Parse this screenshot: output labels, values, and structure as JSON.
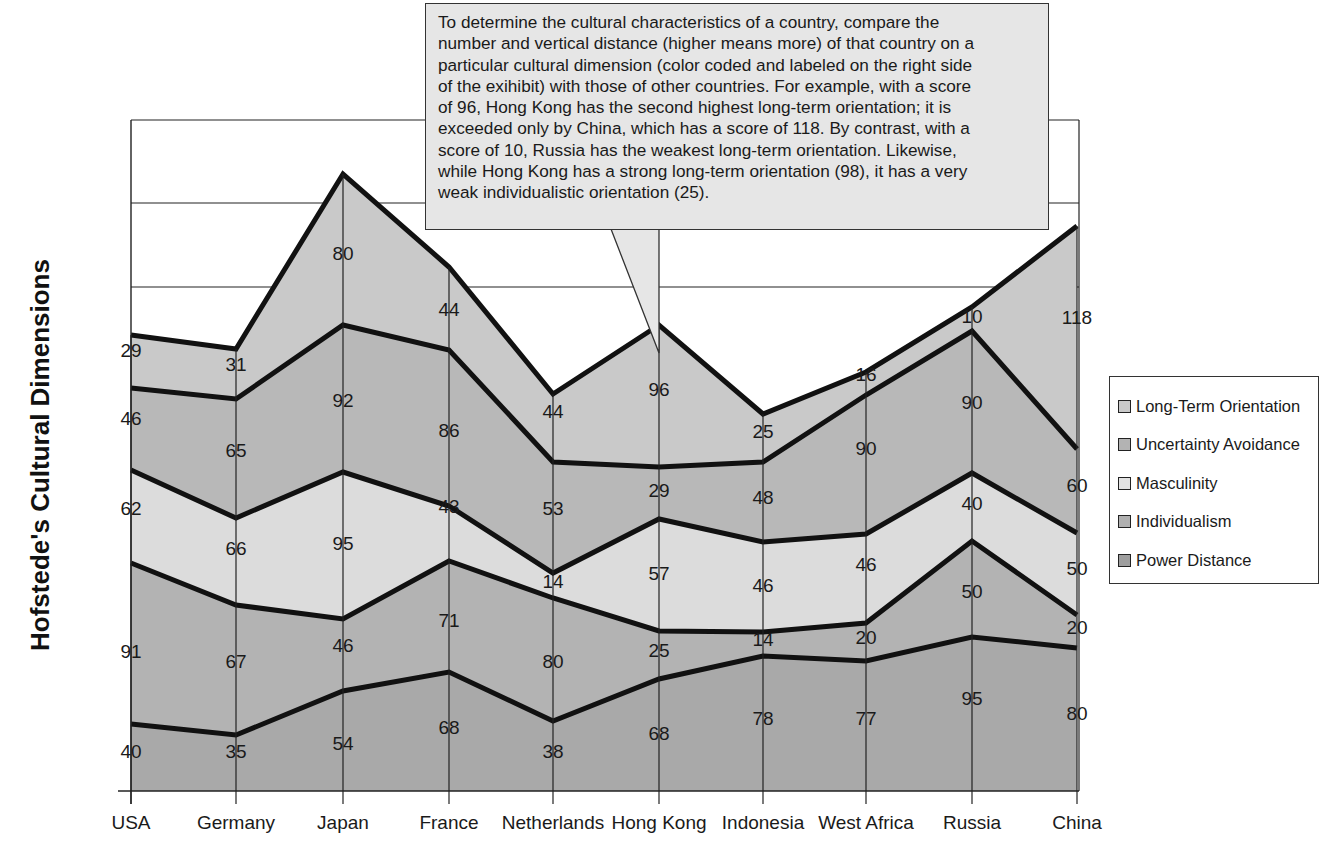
{
  "chart_data": {
    "type": "area",
    "stacked": true,
    "title": "",
    "ylabel": "Hofstede's Cultural Dimensions",
    "xlabel": "",
    "categories": [
      "USA",
      "Germany",
      "Japan",
      "France",
      "Netherlands",
      "Hong Kong",
      "Indonesia",
      "West Africa",
      "Russia",
      "China"
    ],
    "series": [
      {
        "name": "Power Distance",
        "color": "#a9a9a9",
        "values": [
          40,
          35,
          54,
          68,
          38,
          68,
          78,
          77,
          95,
          80
        ]
      },
      {
        "name": "Individualism",
        "color": "#b3b3b3",
        "values": [
          91,
          67,
          46,
          71,
          80,
          25,
          14,
          20,
          50,
          20
        ]
      },
      {
        "name": "Masculinity",
        "color": "#dcdcdc",
        "values": [
          62,
          66,
          95,
          43,
          14,
          57,
          46,
          46,
          40,
          50
        ]
      },
      {
        "name": "Uncertainty Avoidance",
        "color": "#b8b8b8",
        "values": [
          46,
          65,
          92,
          86,
          53,
          29,
          48,
          90,
          90,
          60
        ]
      },
      {
        "name": "Long-Term Orientation",
        "color": "#c9c9c9",
        "values": [
          29,
          31,
          80,
          44,
          44,
          96,
          25,
          16,
          10,
          118
        ]
      }
    ],
    "legend": {
      "position": "right",
      "entries": [
        "Long-Term Orientation",
        "Uncertainty Avoidance",
        "Masculinity",
        "Individualism",
        "Power Distance"
      ]
    },
    "grid": {
      "horizontal": true,
      "vertical_at_categories": true
    },
    "annotation": "To determine the cultural characteristics of a country, compare the number and vertical distance (higher means more) of that country on a particular cultural dimension (color coded and labeled on the right side of the exihibit) with those of other countries. For example, with a score of 96, Hong Kong has the second highest long-term orientation; it is exceeded only by China, which has a score of 118. By contrast, with a score of 10, Russia has the weakest long-term orientation. Likewise, while Hong Kong has a strong long-term orientation (98), it has a very weak individualistic orientation (25)."
  },
  "layout": {
    "x_px": [
      131,
      236,
      343,
      449,
      553,
      659,
      763,
      866,
      972,
      1077
    ],
    "baseline_px": 791,
    "plot_left": 131,
    "plot_right": 1079,
    "plot_top": 120,
    "gridlines_px": [
      120,
      203,
      287
    ],
    "boundaries_px": [
      [
        724,
        735,
        691,
        672,
        721,
        679,
        656,
        661,
        637,
        648
      ],
      [
        563,
        605,
        619,
        561,
        598,
        631,
        632,
        623,
        541,
        615
      ],
      [
        470,
        518,
        472,
        506,
        573,
        519,
        542,
        534,
        473,
        533
      ],
      [
        388,
        399,
        325,
        350,
        462,
        467,
        462,
        395,
        331,
        449
      ],
      [
        335,
        349,
        174,
        267,
        394,
        325,
        414,
        372,
        307,
        226
      ]
    ],
    "label_px": [
      [
        [
          131,
          758
        ],
        [
          236,
          758
        ],
        [
          343,
          750
        ],
        [
          449,
          734
        ],
        [
          553,
          758
        ],
        [
          659,
          740
        ],
        [
          763,
          725
        ],
        [
          866,
          725
        ],
        [
          972,
          705
        ],
        [
          1077,
          720
        ]
      ],
      [
        [
          131,
          658
        ],
        [
          236,
          668
        ],
        [
          343,
          652
        ],
        [
          449,
          627
        ],
        [
          553,
          668
        ],
        [
          659,
          657
        ],
        [
          763,
          646
        ],
        [
          866,
          644
        ],
        [
          972,
          598
        ],
        [
          1077,
          634
        ]
      ],
      [
        [
          131,
          515
        ],
        [
          236,
          555
        ],
        [
          343,
          550
        ],
        [
          449,
          513
        ],
        [
          553,
          588
        ],
        [
          659,
          580
        ],
        [
          763,
          592
        ],
        [
          866,
          571
        ],
        [
          972,
          510
        ],
        [
          1077,
          575
        ]
      ],
      [
        [
          131,
          425
        ],
        [
          236,
          457
        ],
        [
          343,
          407
        ],
        [
          449,
          437
        ],
        [
          553,
          515
        ],
        [
          659,
          497
        ],
        [
          763,
          504
        ],
        [
          866,
          455
        ],
        [
          972,
          409
        ],
        [
          1077,
          492
        ]
      ],
      [
        [
          131,
          357
        ],
        [
          236,
          371
        ],
        [
          343,
          260
        ],
        [
          449,
          316
        ],
        [
          553,
          418
        ],
        [
          659,
          396
        ],
        [
          763,
          438
        ],
        [
          866,
          381
        ],
        [
          972,
          323
        ],
        [
          1077,
          324
        ]
      ]
    ]
  },
  "callout": {
    "lines": [
      "To determine the cultural characteristics of a country, compare the",
      "number and vertical distance (higher means more) of that country on a",
      "particular cultural dimension (color coded and labeled on the right side",
      "of the exihibit) with those of other countries.  For example, with a score",
      "of 96, Hong Kong has the second highest long-term orientation; it is",
      "exceeded only by China, which has a score of 118.  By contrast, with a",
      "score of 10, Russia has the weakest long-term orientation.  Likewise,",
      "while Hong Kong has a strong long-term orientation (98), it has a very",
      "weak individualistic orientation (25)."
    ],
    "background": "#e6e6e6"
  },
  "legend": {
    "items": [
      {
        "label": "Long-Term Orientation",
        "color": "#c9c9c9"
      },
      {
        "label": "Uncertainty Avoidance",
        "color": "#b3b3b3"
      },
      {
        "label": "Masculinity",
        "color": "#e2e2e2"
      },
      {
        "label": "Individualism",
        "color": "#b0b0b0"
      },
      {
        "label": "Power Distance",
        "color": "#9e9e9e"
      }
    ]
  },
  "axis": {
    "ytitle": "Hofstede's Cultural Dimensions"
  }
}
